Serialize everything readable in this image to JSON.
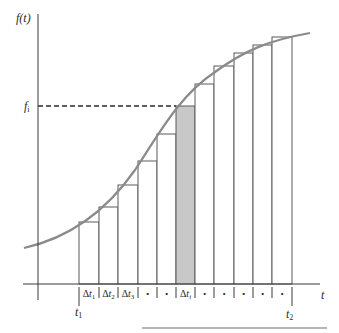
{
  "figure": {
    "y_axis_label": "f(t)",
    "x_axis_label": "t",
    "fi_label": "f",
    "fi_sub": "i",
    "t1_label": "t",
    "t1_sub": "1",
    "t2_label": "t",
    "t2_sub": "2",
    "interval_labels": [
      "Δt1",
      "Δt2",
      "Δt3",
      "•",
      "•",
      "Δti",
      "•",
      "•",
      "•",
      "•",
      "•"
    ],
    "colors": {
      "axis": "#3a3a3a",
      "curve": "#8a8a8a",
      "bar_stroke": "#5a5a5a",
      "shaded_fill": "#c8c8c8",
      "bottom_rule": "#b5b5b5"
    }
  },
  "chart_data": {
    "type": "diagram",
    "xlabel": "t",
    "ylabel": "f(t)",
    "bars": {
      "count": 11,
      "left_edges_px": [
        79,
        99,
        118,
        138,
        157,
        176,
        195,
        214,
        234,
        253,
        272
      ],
      "right_end_px": 292,
      "tops_px": [
        222,
        207,
        185,
        161,
        134,
        106,
        84,
        66,
        53,
        45,
        37
      ],
      "shaded_index": 5
    },
    "annotations": [
      "f_i dashed reference line to shaded bar top",
      "t_1 at left end",
      "t_2 at right end"
    ]
  }
}
